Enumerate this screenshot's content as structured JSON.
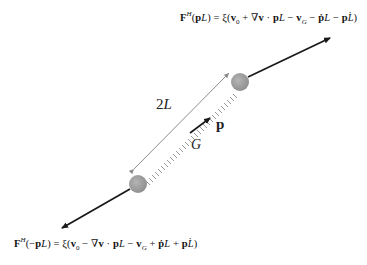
{
  "equations": {
    "top": "Fᴴ(pL) = ξ(v₀ + ∇v · pL − vᴳ − ṗL − pL̇)",
    "bottom": "Fᴴ(−pL) = ξ(v₀ − ∇v · pL − vᴳ + ṗL + pL̇)"
  },
  "labels": {
    "length": "2L",
    "orientation": "p",
    "center": "G"
  },
  "colors": {
    "bead": "#9a9a9a",
    "force_arrow": "#1a1a1a",
    "length_arrow": "#8c8c8c",
    "spring": "#9a9a9a"
  }
}
